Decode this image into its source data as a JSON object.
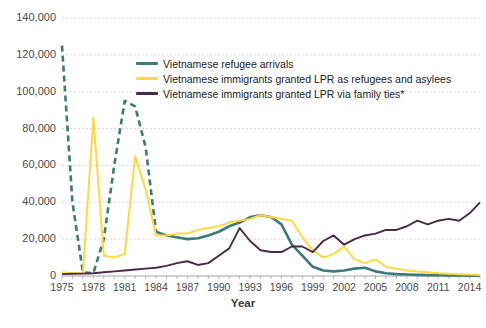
{
  "chart_data": {
    "type": "line",
    "title": "",
    "xlabel": "Year",
    "ylabel": "",
    "xlim": [
      1975,
      2015
    ],
    "ylim": [
      0,
      140000
    ],
    "grid": true,
    "legend_position": "top-center",
    "ytick_labels": [
      "140,000",
      "120,000",
      "100,000",
      "80,000",
      "60,000",
      "40,000",
      "20,000",
      "0"
    ],
    "ytick_values": [
      140000,
      120000,
      100000,
      80000,
      60000,
      40000,
      20000,
      0
    ],
    "xtick_labels": [
      "1975",
      "1978",
      "1981",
      "1984",
      "1987",
      "1990",
      "1993",
      "1996",
      "1999",
      "2002",
      "2005",
      "2008",
      "2011",
      "2014"
    ],
    "xtick_values": [
      1975,
      1978,
      1981,
      1984,
      1987,
      1990,
      1993,
      1996,
      1999,
      2002,
      2005,
      2008,
      2011,
      2014
    ],
    "x": [
      1975,
      1976,
      1977,
      1978,
      1979,
      1980,
      1981,
      1982,
      1983,
      1984,
      1985,
      1986,
      1987,
      1988,
      1989,
      1990,
      1991,
      1992,
      1993,
      1994,
      1995,
      1996,
      1997,
      1998,
      1999,
      2000,
      2001,
      2002,
      2003,
      2004,
      2005,
      2006,
      2007,
      2008,
      2009,
      2010,
      2011,
      2012,
      2013,
      2014,
      2015
    ],
    "series": [
      {
        "name": "Vietnamese refugee arrivals",
        "color": "#3d7a78",
        "style": "dashed-then-solid",
        "values": [
          125000,
          40000,
          2000,
          1500,
          20000,
          60000,
          95000,
          92000,
          70000,
          24000,
          22000,
          21000,
          20000,
          20500,
          22000,
          24000,
          27000,
          29000,
          32000,
          33000,
          32000,
          28000,
          17000,
          11000,
          5000,
          3000,
          2500,
          3000,
          4000,
          4500,
          2500,
          1500,
          1000,
          800,
          600,
          500,
          400,
          300,
          250,
          200,
          150
        ]
      },
      {
        "name": "Vietnamese immigrants granted LPR as refugees and asylees",
        "color": "#ffd93d",
        "style": "solid",
        "values": [
          2000,
          1500,
          1500,
          86000,
          11000,
          10000,
          12000,
          65000,
          47000,
          22000,
          22000,
          23000,
          23000,
          25000,
          26000,
          27000,
          29000,
          30000,
          31000,
          33000,
          32000,
          31000,
          30000,
          21000,
          14000,
          10000,
          12000,
          16000,
          9000,
          7000,
          9000,
          5000,
          4000,
          3000,
          2500,
          2000,
          1500,
          1200,
          1000,
          800,
          600
        ]
      },
      {
        "name": "Vietnamese immigrants granted LPR via family ties*",
        "color": "#4a2a4a",
        "style": "solid",
        "values": [
          1000,
          1200,
          1300,
          1500,
          2000,
          2500,
          3000,
          3500,
          4000,
          4500,
          5500,
          7000,
          8000,
          6000,
          7000,
          11000,
          15000,
          26000,
          19000,
          14000,
          13000,
          13000,
          16000,
          16000,
          13000,
          19000,
          22000,
          17000,
          20000,
          22000,
          23000,
          25000,
          25000,
          27000,
          30000,
          28000,
          30000,
          31000,
          30000,
          34000,
          40000
        ]
      }
    ]
  }
}
